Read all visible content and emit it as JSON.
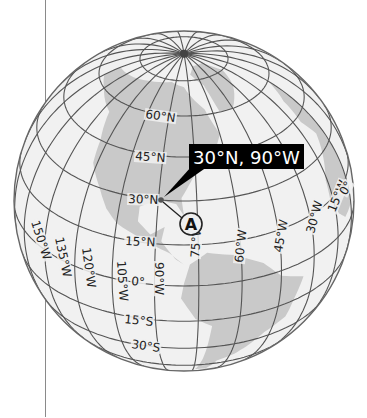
{
  "globe": {
    "center": [
      184,
      201
    ],
    "radius": 170,
    "center_lat": 30,
    "center_lon": -80,
    "ocean_color": "#f1f1f1",
    "land_color": "#c9c9c9",
    "grid_color": "#555555",
    "latitudes": [
      -60,
      -45,
      -30,
      -15,
      0,
      15,
      30,
      45,
      60,
      75
    ],
    "meridian_step": 15
  },
  "lat_labels": [
    {
      "text": "60°N",
      "x": 145,
      "y": 118,
      "rot": 8
    },
    {
      "text": "45°N",
      "x": 135,
      "y": 160,
      "rot": 4
    },
    {
      "text": "30°N",
      "x": 128,
      "y": 203,
      "rot": 2
    },
    {
      "text": "15°N",
      "x": 125,
      "y": 245,
      "rot": 3
    },
    {
      "text": "0°",
      "x": 131,
      "y": 285,
      "rot": 5
    },
    {
      "text": "15°S",
      "x": 124,
      "y": 323,
      "rot": 6
    },
    {
      "text": "30°S",
      "x": 131,
      "y": 348,
      "rot": 8
    }
  ],
  "lon_labels": [
    {
      "text": "150°W",
      "x": 31,
      "y": 222,
      "rot": 72
    },
    {
      "text": "135°W",
      "x": 55,
      "y": 238,
      "rot": 78
    },
    {
      "text": "120°W",
      "x": 82,
      "y": 248,
      "rot": 82
    },
    {
      "text": "105°W",
      "x": 117,
      "y": 261,
      "rot": 86
    },
    {
      "text": "90°W",
      "x": 155,
      "y": 262,
      "rot": 90
    },
    {
      "text": "75°W",
      "x": 199,
      "y": 258,
      "rot": -86
    },
    {
      "text": "60°W",
      "x": 243,
      "y": 263,
      "rot": -84
    },
    {
      "text": "45°W",
      "x": 282,
      "y": 253,
      "rot": -80
    },
    {
      "text": "30°W",
      "x": 314,
      "y": 234,
      "rot": -75
    },
    {
      "text": "15°W",
      "x": 335,
      "y": 213,
      "rot": -68
    },
    {
      "text": "0°",
      "x": 346,
      "y": 196,
      "rot": -60
    }
  ],
  "callout": {
    "text": "30°N, 90°W",
    "box": [
      189,
      144,
      115,
      25
    ],
    "bg_color": "#000000",
    "text_color": "#ffffff"
  },
  "point": {
    "lat": 30,
    "lon": -90,
    "x": 161,
    "y": 200
  },
  "marker": {
    "label": "A",
    "x": 191,
    "y": 224,
    "r": 11,
    "fill": "#eeeeee"
  },
  "land": [
    {
      "name": "north-america",
      "points": [
        [
          -165,
          68
        ],
        [
          -140,
          70
        ],
        [
          -120,
          72
        ],
        [
          -95,
          74
        ],
        [
          -80,
          72
        ],
        [
          -65,
          62
        ],
        [
          -60,
          52
        ],
        [
          -66,
          45
        ],
        [
          -76,
          38
        ],
        [
          -81,
          31
        ],
        [
          -80,
          25
        ],
        [
          -83,
          29
        ],
        [
          -90,
          30
        ],
        [
          -97,
          27
        ],
        [
          -97,
          22
        ],
        [
          -92,
          18
        ],
        [
          -87,
          21
        ],
        [
          -88,
          16
        ],
        [
          -83,
          10
        ],
        [
          -80,
          8
        ],
        [
          -85,
          12
        ],
        [
          -92,
          15
        ],
        [
          -105,
          20
        ],
        [
          -110,
          24
        ],
        [
          -115,
          30
        ],
        [
          -122,
          37
        ],
        [
          -124,
          45
        ],
        [
          -130,
          55
        ],
        [
          -150,
          60
        ],
        [
          -165,
          62
        ]
      ]
    },
    {
      "name": "greenland",
      "points": [
        [
          -55,
          60
        ],
        [
          -45,
          60
        ],
        [
          -30,
          68
        ],
        [
          -20,
          75
        ],
        [
          -30,
          82
        ],
        [
          -60,
          82
        ],
        [
          -70,
          78
        ],
        [
          -58,
          72
        ]
      ]
    },
    {
      "name": "south-america",
      "points": [
        [
          -78,
          8
        ],
        [
          -72,
          12
        ],
        [
          -62,
          10
        ],
        [
          -52,
          5
        ],
        [
          -45,
          -2
        ],
        [
          -35,
          -6
        ],
        [
          -38,
          -14
        ],
        [
          -40,
          -22
        ],
        [
          -48,
          -27
        ],
        [
          -54,
          -34
        ],
        [
          -58,
          -38
        ],
        [
          -65,
          -42
        ],
        [
          -68,
          -52
        ],
        [
          -74,
          -52
        ],
        [
          -72,
          -40
        ],
        [
          -71,
          -30
        ],
        [
          -70,
          -18
        ],
        [
          -76,
          -14
        ],
        [
          -81,
          -5
        ],
        [
          -80,
          1
        ]
      ]
    },
    {
      "name": "africa-europe",
      "points": [
        [
          -17,
          15
        ],
        [
          -16,
          22
        ],
        [
          -10,
          30
        ],
        [
          -6,
          36
        ],
        [
          -10,
          43
        ],
        [
          -8,
          52
        ],
        [
          -2,
          58
        ],
        [
          0,
          60
        ],
        [
          0,
          5
        ],
        [
          -8,
          4
        ],
        [
          -13,
          8
        ]
      ]
    }
  ],
  "divider": {
    "x": 45,
    "color": "#8a8a8a"
  }
}
